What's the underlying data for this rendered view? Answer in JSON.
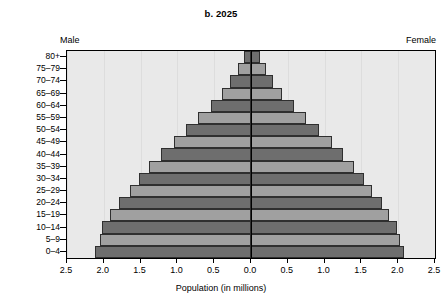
{
  "chart_data": {
    "type": "bar",
    "subtype": "population-pyramid",
    "title": "b. 2025",
    "xlabel": "Population (in millions)",
    "ylabel": "",
    "left_side_label": "Male",
    "right_side_label": "Female",
    "categories": [
      "0–4",
      "5–9",
      "10–14",
      "15–19",
      "20–24",
      "25–29",
      "30–34",
      "35–39",
      "40–44",
      "45–49",
      "50–54",
      "55–59",
      "60–64",
      "65–69",
      "70–74",
      "75–79",
      "80+"
    ],
    "series": [
      {
        "name": "Male",
        "side": "left",
        "values": [
          2.12,
          2.05,
          2.02,
          1.92,
          1.8,
          1.65,
          1.52,
          1.38,
          1.22,
          1.05,
          0.88,
          0.72,
          0.55,
          0.4,
          0.28,
          0.18,
          0.1
        ]
      },
      {
        "name": "Female",
        "side": "right",
        "values": [
          2.08,
          2.02,
          1.98,
          1.88,
          1.78,
          1.65,
          1.53,
          1.4,
          1.25,
          1.1,
          0.92,
          0.75,
          0.58,
          0.42,
          0.3,
          0.2,
          0.12
        ]
      }
    ],
    "x_tick_values": [
      -2.5,
      -2.0,
      -1.5,
      -1.0,
      -0.5,
      0.0,
      0.5,
      1.0,
      1.5,
      2.0,
      2.5
    ],
    "x_tick_labels": [
      "2.5",
      "2.0",
      "1.5",
      "1.0",
      "0.5",
      "0.0",
      "0.5",
      "1.0",
      "1.5",
      "2.0",
      "2.5"
    ],
    "xlim": [
      -2.5,
      2.5
    ],
    "grid": true,
    "grid_axis": "x",
    "legend": false,
    "colors": {
      "bar_dark": "#6e6e6e",
      "bar_light": "#a0a0a0",
      "bar_border": "#2f2f2f",
      "plot_background": "#e9e9e9",
      "gridline": "#dddddd",
      "axis": "#000000",
      "page_background": "#ffffff"
    }
  }
}
